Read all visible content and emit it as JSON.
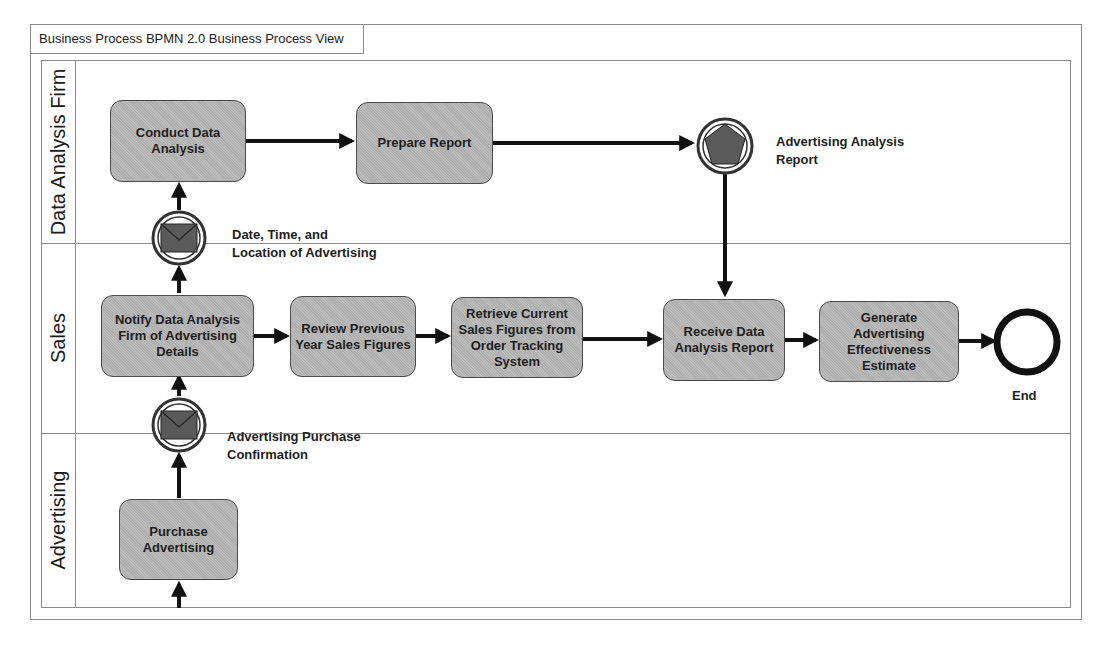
{
  "diagram": {
    "title": "Business Process BPMN 2.0 Business Process View",
    "colors": {
      "task_fill": "#b8b8b8",
      "task_border": "#4a4a4a",
      "line": "#111111",
      "frame": "#8a8a8a"
    },
    "lanes": [
      {
        "id": "data-analysis-firm",
        "label": "Data Analysis Firm"
      },
      {
        "id": "sales",
        "label": "Sales"
      },
      {
        "id": "advertising",
        "label": "Advertising"
      }
    ],
    "tasks": {
      "conduct_data_analysis": "Conduct Data Analysis",
      "prepare_report": "Prepare Report",
      "notify_firm": "Notify Data Analysis Firm of Advertising  Details",
      "review_previous": "Review Previous Year Sales Figures",
      "retrieve_current": "Retrieve Current Sales Figures from Order Tracking System",
      "receive_report": "Receive Data Analysis Report",
      "generate_estimate": "Generate Advertising Effectiveness Estimate",
      "purchase_advertising": "Purchase Advertising"
    },
    "events": {
      "msg_date_time_line1": "Date, Time, and",
      "msg_date_time_line2": "Location of Advertising",
      "signal_report_line1": "Advertising Analysis",
      "signal_report_line2": "Report",
      "msg_purchase_line1": "Advertising Purchase",
      "msg_purchase_line2": "Confirmation",
      "end_label": "End"
    }
  }
}
